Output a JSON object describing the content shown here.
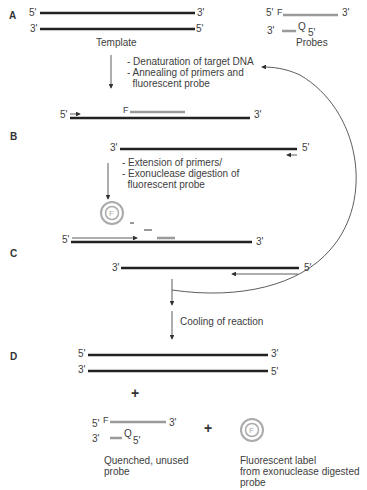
{
  "steps": {
    "a": "A",
    "b": "B",
    "c": "C",
    "d": "D"
  },
  "ends": {
    "five": "5'",
    "three": "3'"
  },
  "labels": {
    "template": "Template",
    "probes": "Probes",
    "fluor": "F",
    "quencher": "Q",
    "fluor_circle": "F"
  },
  "process_notes": {
    "a_to_b": [
      "- Denaturation of target DNA",
      "- Annealing of primers and",
      "  fluorescent probe"
    ],
    "b_to_c": [
      "- Extension of primers/",
      "- Exonuclease digestion of",
      "  fluorescent probe"
    ],
    "c_to_d": "Cooling of reaction"
  },
  "products": {
    "plus": "+",
    "quenched_probe": [
      "Quenched, unused",
      "probe"
    ],
    "fluorescent_label": [
      "Fluorescent label",
      "from exonuclease digested",
      "probe"
    ]
  },
  "colors": {
    "strand": "#222222",
    "probe": "#9a9a9a",
    "arrow": "#333333",
    "text": "#3d3d3d"
  }
}
